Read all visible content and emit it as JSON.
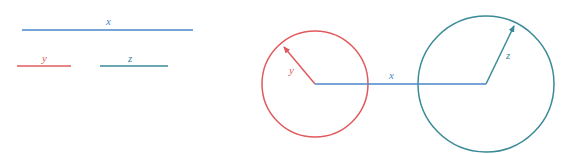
{
  "colors": {
    "x": "#4a86c8",
    "y": "#e05a5e",
    "z": "#3a8a98"
  },
  "legend": {
    "x_label": "x",
    "y_label": "y",
    "z_label": "z"
  },
  "figure": {
    "x_label": "x",
    "y_label": "y",
    "z_label": "z"
  }
}
